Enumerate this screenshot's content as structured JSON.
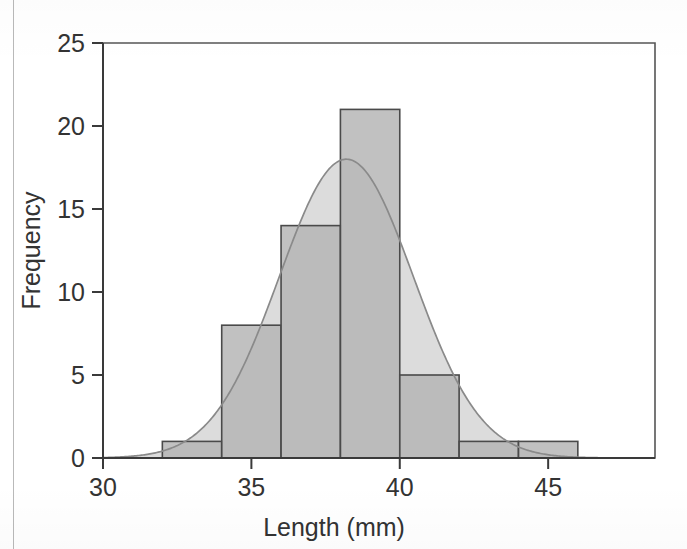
{
  "figure": {
    "background_color": "#ffffff",
    "frame_color": "#4a4a4a",
    "axis_color": "#333333"
  },
  "axes": {
    "y_title": "Frequency",
    "x_title": "Length (mm)",
    "y_ticks": [
      "0",
      "5",
      "10",
      "15",
      "20",
      "25"
    ],
    "x_ticks": [
      "30",
      "35",
      "40",
      "45"
    ]
  },
  "chart_data": {
    "type": "bar",
    "title": "",
    "subtitle": "",
    "xlabel": "Length (mm)",
    "ylabel": "Frequency",
    "xlim": [
      30,
      48.6
    ],
    "ylim": [
      0,
      25
    ],
    "grid": false,
    "legend": "none",
    "bin_width": 2,
    "bin_edges": [
      32,
      34,
      36,
      38,
      40,
      42,
      44,
      46
    ],
    "categories": [
      "32-34",
      "34-36",
      "36-38",
      "38-40",
      "40-42",
      "42-44",
      "44-46"
    ],
    "bin_centers": [
      33,
      35,
      37,
      39,
      41,
      43,
      45
    ],
    "values": [
      1,
      8,
      14,
      21,
      5,
      1,
      1
    ],
    "total_count": 51,
    "bar_fill_color": "#b3b3b3",
    "bar_edge_color": "#4a4a4a",
    "overlay": {
      "type": "line",
      "name": "normal curve",
      "peak_x": 38.2,
      "peak_y": 18,
      "mean": 38.2,
      "std_dev": 2.26,
      "fill_color": "#dcdcdc",
      "line_color": "#8a8a8a"
    },
    "x_tick_values": [
      30,
      35,
      40,
      45
    ],
    "y_tick_values": [
      0,
      5,
      10,
      15,
      20,
      25
    ]
  }
}
